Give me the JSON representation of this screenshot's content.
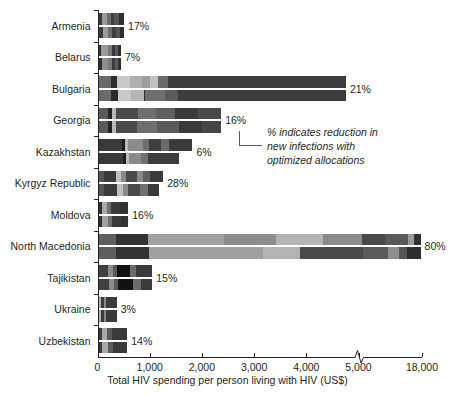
{
  "chart_data": {
    "type": "bar",
    "orientation": "horizontal",
    "title": "",
    "xlabel": "Total HIV spending per person living with HIV (US$)",
    "ylabel": "",
    "categories": [
      "Armenia",
      "Belarus",
      "Bulgaria",
      "Georgia",
      "Kazakhstan",
      "Kyrgyz Republic",
      "Moldova",
      "North Macedonia",
      "Tajikistan",
      "Ukraine",
      "Uzbekistan"
    ],
    "annotations": [
      "17%",
      "7%",
      "21%",
      "16%",
      "6%",
      "28%",
      "16%",
      "80%",
      "15%",
      "3%",
      "14%"
    ],
    "annotation_note": "% indicates reduction in\nnew infections with\noptimized allocations",
    "xticks": [
      0,
      1000,
      2000,
      3000,
      4000,
      5000,
      18000
    ],
    "xtick_labels": [
      "0",
      "1,000",
      "2,000",
      "3,000",
      "4,000",
      "5,000",
      "18,000"
    ],
    "axis_break": true,
    "axis_break_between": [
      5000,
      18000
    ],
    "grid": false,
    "legend": "none",
    "series": [
      {
        "name": "Current allocation",
        "totals": [
          490,
          430,
          4740,
          2350,
          1800,
          1240,
          570,
          17500,
          1030,
          350,
          550
        ]
      },
      {
        "name": "Optimized allocation",
        "totals": [
          490,
          430,
          4740,
          2350,
          1550,
          1150,
          570,
          17500,
          1030,
          350,
          550
        ]
      }
    ],
    "bars": [
      {
        "country": "Armenia",
        "current": [
          [
            0,
            75,
            "#3a3a3a"
          ],
          [
            75,
            95,
            "#9a9a9a"
          ],
          [
            170,
            70,
            "#6e6e6e"
          ],
          [
            240,
            60,
            "#3f3f3f"
          ],
          [
            300,
            100,
            "#555555"
          ],
          [
            400,
            90,
            "#303030"
          ]
        ],
        "optimized": [
          [
            0,
            80,
            "#3a3a3a"
          ],
          [
            80,
            105,
            "#9a9a9a"
          ],
          [
            185,
            80,
            "#6e6e6e"
          ],
          [
            265,
            65,
            "#3f3f3f"
          ],
          [
            330,
            90,
            "#555555"
          ],
          [
            420,
            70,
            "#303030"
          ]
        ]
      },
      {
        "country": "Belarus",
        "current": [
          [
            0,
            55,
            "#303030"
          ],
          [
            55,
            120,
            "#9a9a9a"
          ],
          [
            175,
            75,
            "#7a7a7a"
          ],
          [
            250,
            60,
            "#3a3a3a"
          ],
          [
            310,
            55,
            "#5a5a5a"
          ],
          [
            365,
            65,
            "#2e2e2e"
          ]
        ],
        "optimized": [
          [
            0,
            60,
            "#303030"
          ],
          [
            60,
            125,
            "#8e8e8e"
          ],
          [
            185,
            70,
            "#7a7a7a"
          ],
          [
            255,
            60,
            "#3a3a3a"
          ],
          [
            315,
            50,
            "#5a5a5a"
          ],
          [
            365,
            65,
            "#2e2e2e"
          ]
        ]
      },
      {
        "country": "Bulgaria",
        "current": [
          [
            0,
            230,
            "#6a6a6a"
          ],
          [
            230,
            130,
            "#2b2b2b"
          ],
          [
            360,
            250,
            "#c9c9c9"
          ],
          [
            610,
            230,
            "#b0b0b0"
          ],
          [
            840,
            140,
            "#9e9e9e"
          ],
          [
            980,
            160,
            "#c2c2c2"
          ],
          [
            1140,
            190,
            "#6a6a6a"
          ],
          [
            1330,
            3410,
            "#3c3c3c"
          ]
        ],
        "optimized": [
          [
            0,
            240,
            "#6a6a6a"
          ],
          [
            240,
            130,
            "#2b2b2b"
          ],
          [
            370,
            250,
            "#c9c9c9"
          ],
          [
            620,
            250,
            "#b5b5b5"
          ],
          [
            870,
            30,
            "#2b2b2b"
          ],
          [
            900,
            370,
            "#6e6e6e"
          ],
          [
            1270,
            260,
            "#5a5a5a"
          ],
          [
            1530,
            3210,
            "#3c3c3c"
          ]
        ]
      },
      {
        "country": "Georgia",
        "current": [
          [
            0,
            190,
            "#5a5a5a"
          ],
          [
            190,
            70,
            "#242424"
          ],
          [
            260,
            70,
            "#b8b8b8"
          ],
          [
            330,
            420,
            "#4a4a4a"
          ],
          [
            750,
            350,
            "#6e6e6e"
          ],
          [
            1100,
            360,
            "#5f5f5f"
          ],
          [
            1460,
            440,
            "#3a3a3a"
          ],
          [
            1900,
            450,
            "#4a4a4a"
          ]
        ],
        "optimized": [
          [
            0,
            190,
            "#5a5a5a"
          ],
          [
            190,
            70,
            "#242424"
          ],
          [
            260,
            75,
            "#b8b8b8"
          ],
          [
            335,
            400,
            "#4a4a4a"
          ],
          [
            735,
            380,
            "#6e6e6e"
          ],
          [
            1115,
            420,
            "#5a5a5a"
          ],
          [
            1535,
            440,
            "#3a3a3a"
          ],
          [
            1975,
            375,
            "#464646"
          ]
        ]
      },
      {
        "country": "Kazakhstan",
        "current": [
          [
            0,
            450,
            "#3a3a3a"
          ],
          [
            450,
            60,
            "#1e1e1e"
          ],
          [
            510,
            60,
            "#bcbcbc"
          ],
          [
            570,
            290,
            "#8a8a8a"
          ],
          [
            860,
            110,
            "#6e6e6e"
          ],
          [
            970,
            220,
            "#3f3f3f"
          ],
          [
            1190,
            160,
            "#6a6a6a"
          ],
          [
            1350,
            450,
            "#3a3a3a"
          ]
        ],
        "optimized": [
          [
            0,
            460,
            "#3a3a3a"
          ],
          [
            460,
            65,
            "#1e1e1e"
          ],
          [
            525,
            55,
            "#bcbcbc"
          ],
          [
            580,
            240,
            "#8a8a8a"
          ],
          [
            820,
            130,
            "#707070"
          ],
          [
            950,
            600,
            "#3d3d3d"
          ]
        ]
      },
      {
        "country": "Kyrgyz Republic",
        "current": [
          [
            0,
            100,
            "#545454"
          ],
          [
            100,
            230,
            "#3a3a3a"
          ],
          [
            330,
            100,
            "#c0c0c0"
          ],
          [
            430,
            90,
            "#8a8a8a"
          ],
          [
            520,
            210,
            "#4a4a4a"
          ],
          [
            730,
            130,
            "#8a8a8a"
          ],
          [
            860,
            130,
            "#5f5f5f"
          ],
          [
            990,
            250,
            "#3a3a3a"
          ]
        ],
        "optimized": [
          [
            0,
            110,
            "#545454"
          ],
          [
            110,
            240,
            "#3a3a3a"
          ],
          [
            350,
            110,
            "#c0c0c0"
          ],
          [
            460,
            100,
            "#8a8a8a"
          ],
          [
            560,
            230,
            "#4a4a4a"
          ],
          [
            790,
            150,
            "#707070"
          ],
          [
            940,
            210,
            "#3a3a3a"
          ]
        ]
      },
      {
        "country": "Moldova",
        "current": [
          [
            0,
            60,
            "#303030"
          ],
          [
            60,
            110,
            "#a8a8a8"
          ],
          [
            170,
            70,
            "#6e6e6e"
          ],
          [
            240,
            180,
            "#3a3a3a"
          ],
          [
            420,
            150,
            "#323232"
          ]
        ],
        "optimized": [
          [
            0,
            65,
            "#303030"
          ],
          [
            65,
            120,
            "#a0a0a0"
          ],
          [
            185,
            80,
            "#6e6e6e"
          ],
          [
            265,
            170,
            "#3a3a3a"
          ],
          [
            435,
            135,
            "#323232"
          ]
        ]
      },
      {
        "country": "North Macedonia",
        "current": [
          [
            0,
            330,
            "#5e5e5e"
          ],
          [
            330,
            620,
            "#333333"
          ],
          [
            950,
            1450,
            "#a0a0a0"
          ],
          [
            2400,
            1000,
            "#8d8d8d"
          ],
          [
            3400,
            900,
            "#b4b4b4"
          ],
          [
            4300,
            1200,
            "#8a8a8a"
          ],
          [
            5500,
            4700,
            "#4a4a4a"
          ],
          [
            10200,
            4800,
            "#5a5a5a"
          ],
          [
            15000,
            1200,
            "#9a9a9a"
          ],
          [
            16200,
            1300,
            "#333333"
          ]
        ],
        "optimized": [
          [
            0,
            340,
            "#5e5e5e"
          ],
          [
            340,
            620,
            "#333333"
          ],
          [
            960,
            2200,
            "#a0a0a0"
          ],
          [
            3160,
            700,
            "#b4b4b4"
          ],
          [
            3860,
            1900,
            "#4a4a4a"
          ],
          [
            5760,
            5100,
            "#5a5a5a"
          ],
          [
            10860,
            2300,
            "#8e8e8e"
          ],
          [
            13160,
            1500,
            "#555555"
          ],
          [
            14660,
            2840,
            "#2e2e2e"
          ]
        ]
      },
      {
        "country": "Tajikistan",
        "current": [
          [
            0,
            190,
            "#404040"
          ],
          [
            190,
            80,
            "#8a8a8a"
          ],
          [
            270,
            80,
            "#5a5a5a"
          ],
          [
            350,
            250,
            "#121212"
          ],
          [
            600,
            120,
            "#6a6a6a"
          ],
          [
            720,
            310,
            "#3a3a3a"
          ]
        ],
        "optimized": [
          [
            0,
            200,
            "#404040"
          ],
          [
            200,
            90,
            "#8a8a8a"
          ],
          [
            290,
            80,
            "#5a5a5a"
          ],
          [
            370,
            300,
            "#121212"
          ],
          [
            670,
            140,
            "#6a6a6a"
          ],
          [
            810,
            220,
            "#3a3a3a"
          ]
        ]
      },
      {
        "country": "Ukraine",
        "current": [
          [
            0,
            40,
            "#b0b0b0"
          ],
          [
            40,
            60,
            "#3a3a3a"
          ],
          [
            100,
            50,
            "#8a8a8a"
          ],
          [
            150,
            200,
            "#3a3a3a"
          ]
        ],
        "optimized": [
          [
            0,
            45,
            "#b0b0b0"
          ],
          [
            45,
            60,
            "#3a3a3a"
          ],
          [
            105,
            45,
            "#8a8a8a"
          ],
          [
            150,
            200,
            "#3a3a3a"
          ]
        ]
      },
      {
        "country": "Uzbekistan",
        "current": [
          [
            0,
            60,
            "#3a3a3a"
          ],
          [
            60,
            110,
            "#a8a8a8"
          ],
          [
            170,
            90,
            "#5a5a5a"
          ],
          [
            260,
            290,
            "#3a3a3a"
          ]
        ],
        "optimized": [
          [
            0,
            65,
            "#3a3a3a"
          ],
          [
            65,
            115,
            "#a8a8a8"
          ],
          [
            180,
            95,
            "#5a5a5a"
          ],
          [
            275,
            275,
            "#3a3a3a"
          ]
        ]
      }
    ]
  },
  "axis": {
    "x_title": "Total HIV spending per person living with HIV (US$)",
    "tick_labels": [
      "0",
      "1,000",
      "2,000",
      "3,000",
      "4,000",
      "5,000",
      "18,000"
    ]
  },
  "note": {
    "line1": "% indicates reduction in",
    "line2": "new infections with",
    "line3": "optimized allocations"
  },
  "colors": {
    "axis": "#231f20",
    "text": "#231f20",
    "leader": "#58595b",
    "background": "#ffffff"
  }
}
